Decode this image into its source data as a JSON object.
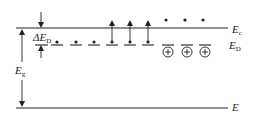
{
  "diagram": {
    "colors": {
      "line": "#222222",
      "background": "#ffffff"
    },
    "levels": {
      "conduction_band": {
        "label": "E",
        "sub": "c",
        "y": 28
      },
      "donor_level": {
        "label": "E",
        "sub": "D",
        "y": 45
      },
      "valence_band": {
        "label": "E",
        "sub": "",
        "y": 108
      }
    },
    "annotations": {
      "donor_ionization_energy": {
        "prefix": "ΔE",
        "sub": "D"
      },
      "band_gap": {
        "label": "E",
        "sub": "g"
      }
    },
    "neutral_donors": [
      {
        "x": 57,
        "excited": false
      },
      {
        "x": 76,
        "excited": false
      },
      {
        "x": 94,
        "excited": false
      },
      {
        "x": 112,
        "excited": true
      },
      {
        "x": 130,
        "excited": true
      },
      {
        "x": 148,
        "excited": true
      }
    ],
    "conduction_electrons": [
      {
        "x": 166
      },
      {
        "x": 185
      },
      {
        "x": 203
      }
    ],
    "ionized_donors": [
      {
        "x": 168,
        "symbol": "+"
      },
      {
        "x": 187,
        "symbol": "+"
      },
      {
        "x": 205,
        "symbol": "+"
      }
    ]
  }
}
